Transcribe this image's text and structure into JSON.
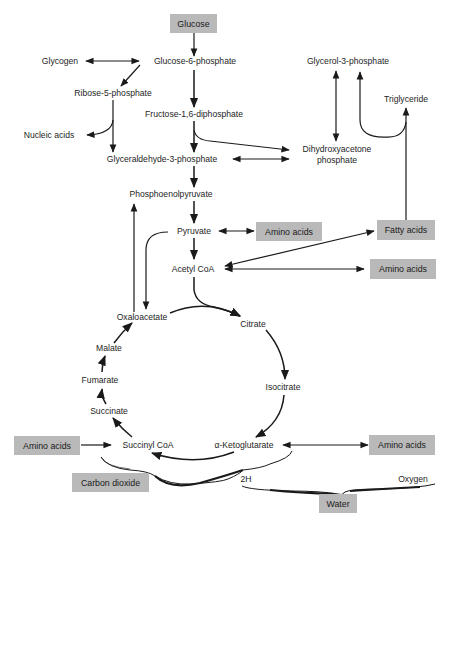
{
  "diagram": {
    "colors": {
      "box_fill": "#b9b9b9",
      "line": "#1a1a1a",
      "background": "#ffffff"
    },
    "boxed_nodes": {
      "glucose": "Glucose",
      "amino_acids_pyruvate": "Amino acids",
      "fatty_acids": "Fatty acids",
      "amino_acids_acetyl": "Amino acids",
      "amino_acids_succinyl": "Amino acids",
      "amino_acids_ketoglutarate": "Amino acids",
      "carbon_dioxide": "Carbon dioxide",
      "water": "Water"
    },
    "nodes": {
      "glycogen": "Glycogen",
      "glucose_6_phosphate": "Glucose-6-phosphate",
      "glycerol_3_phosphate": "Glycerol-3-phosphate",
      "ribose_5_phosphate": "Ribose-5-phosphate",
      "triglyceride": "Triglyceride",
      "fructose_1_6_diphosphate": "Fructose-1,6-diphosphate",
      "nucleic_acids": "Nucleic acids",
      "dihydroxyacetone_line1": "Dihydroxyacetone",
      "dihydroxyacetone_line2": "phosphate",
      "glyceraldehyde_3_phosphate": "Glyceraldehyde-3-phosphate",
      "phosphoenolpyruvate": "Phosphoenolpyruvate",
      "pyruvate": "Pyruvate",
      "acetyl_coa": "Acetyl CoA",
      "oxaloacetate": "Oxaloacetate",
      "citrate": "Citrate",
      "malate": "Malate",
      "fumarate": "Fumarate",
      "isocitrate": "Isocitrate",
      "succinate": "Succinate",
      "succinyl_coa": "Succinyl CoA",
      "alpha_ketoglutarate": "α-Ketoglutarate",
      "two_h": "2H",
      "oxygen": "Oxygen"
    },
    "edges": [
      {
        "from": "Glucose",
        "to": "Glucose-6-phosphate",
        "type": "one-way"
      },
      {
        "from": "Glycogen",
        "to": "Glucose-6-phosphate",
        "type": "two-way"
      },
      {
        "from": "Glucose-6-phosphate",
        "to": "Ribose-5-phosphate",
        "type": "one-way"
      },
      {
        "from": "Glucose-6-phosphate",
        "to": "Fructose-1,6-diphosphate",
        "type": "one-way"
      },
      {
        "from": "Ribose-5-phosphate",
        "to": "Nucleic acids",
        "type": "one-way"
      },
      {
        "from": "Ribose-5-phosphate",
        "to": "Glyceraldehyde-3-phosphate",
        "type": "one-way"
      },
      {
        "from": "Fructose-1,6-diphosphate",
        "to": "Glyceraldehyde-3-phosphate",
        "type": "one-way"
      },
      {
        "from": "Fructose-1,6-diphosphate",
        "to": "Dihydroxyacetone phosphate",
        "type": "one-way"
      },
      {
        "from": "Glyceraldehyde-3-phosphate",
        "to": "Dihydroxyacetone phosphate",
        "type": "two-way"
      },
      {
        "from": "Glycerol-3-phosphate",
        "to": "Dihydroxyacetone phosphate",
        "type": "two-way"
      },
      {
        "from": "Triglyceride",
        "to": "Glycerol-3-phosphate",
        "type": "one-way"
      },
      {
        "from": "Fatty acids",
        "to": "Triglyceride",
        "type": "one-way"
      },
      {
        "from": "Glyceraldehyde-3-phosphate",
        "to": "Phosphoenolpyruvate",
        "type": "one-way"
      },
      {
        "from": "Phosphoenolpyruvate",
        "to": "Pyruvate",
        "type": "one-way"
      },
      {
        "from": "Pyruvate",
        "to": "Amino acids",
        "type": "two-way"
      },
      {
        "from": "Pyruvate",
        "to": "Acetyl CoA",
        "type": "one-way"
      },
      {
        "from": "Pyruvate",
        "to": "Oxaloacetate",
        "type": "one-way"
      },
      {
        "from": "Oxaloacetate",
        "to": "Phosphoenolpyruvate",
        "type": "one-way"
      },
      {
        "from": "Acetyl CoA",
        "to": "Fatty acids",
        "type": "two-way"
      },
      {
        "from": "Acetyl CoA",
        "to": "Amino acids",
        "type": "two-way"
      },
      {
        "from": "Acetyl CoA",
        "to": "Citrate",
        "type": "one-way"
      },
      {
        "from": "Oxaloacetate",
        "to": "Citrate",
        "type": "one-way"
      },
      {
        "from": "Citrate",
        "to": "Isocitrate",
        "type": "one-way"
      },
      {
        "from": "Isocitrate",
        "to": "α-Ketoglutarate",
        "type": "one-way"
      },
      {
        "from": "α-Ketoglutarate",
        "to": "Succinyl CoA",
        "type": "one-way"
      },
      {
        "from": "α-Ketoglutarate",
        "to": "Amino acids",
        "type": "two-way"
      },
      {
        "from": "Amino acids",
        "to": "Succinyl CoA",
        "type": "one-way"
      },
      {
        "from": "Succinyl CoA",
        "to": "Succinate",
        "type": "one-way"
      },
      {
        "from": "Succinate",
        "to": "Fumarate",
        "type": "one-way"
      },
      {
        "from": "Fumarate",
        "to": "Malate",
        "type": "one-way"
      },
      {
        "from": "Malate",
        "to": "Oxaloacetate",
        "type": "one-way"
      }
    ],
    "braces": [
      {
        "over": "Succinyl CoA … α-Ketoglutarate",
        "yields": [
          "Carbon dioxide",
          "2H"
        ]
      },
      {
        "over": "2H … Oxygen",
        "yields": [
          "Water"
        ]
      }
    ]
  }
}
